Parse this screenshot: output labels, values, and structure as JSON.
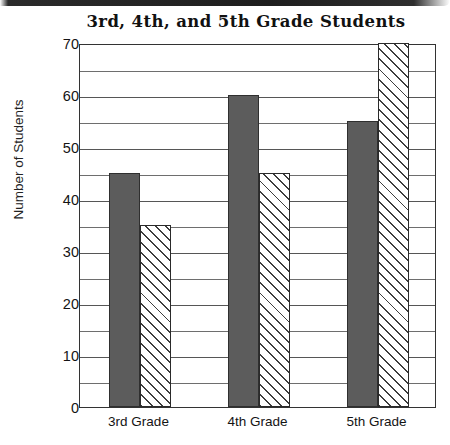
{
  "chart_data": {
    "type": "bar",
    "title": "3rd, 4th, and 5th Grade Students",
    "xlabel": "",
    "ylabel": "Number of Students",
    "categories": [
      "3rd Grade",
      "4th Grade",
      "5th Grade"
    ],
    "series": [
      {
        "name": "solid-gray-series",
        "values": [
          45,
          60,
          55
        ],
        "style": "solid",
        "color": "#5c5c5c"
      },
      {
        "name": "hatched-series",
        "values": [
          35,
          45,
          70
        ],
        "style": "diagonal-hatch",
        "color": "#ffffff"
      }
    ],
    "ylim": [
      0,
      70
    ],
    "y_major_ticks": [
      0,
      10,
      20,
      30,
      40,
      50,
      60,
      70
    ],
    "y_tick_labels": [
      "0",
      "10",
      "20",
      "30",
      "40",
      "50",
      "60",
      "70"
    ],
    "y_minor_tick_step": 5,
    "grid": true,
    "grid_axis": "y",
    "legend": false,
    "legend_position": "none"
  },
  "colors": {
    "bar_solid": "#5c5c5c",
    "bar_outline": "#2f2f2f",
    "grid": "#565656",
    "frame": "#333333",
    "text": "#141414",
    "background": "#ffffff"
  }
}
